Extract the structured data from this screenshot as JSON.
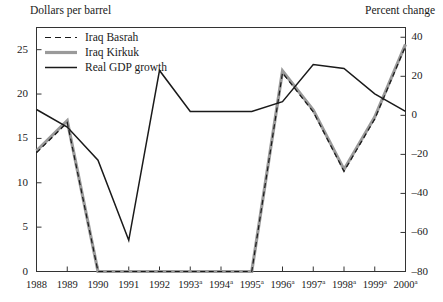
{
  "chart_data": {
    "type": "line",
    "title": "",
    "xlabel": "",
    "ylabel": "Dollars per barrel",
    "ylabel_right": "Percent change",
    "grid": false,
    "legend_position": "top-left",
    "categories": [
      "1988",
      "1989",
      "1990",
      "1991",
      "1992",
      "1993a",
      "1994a",
      "1995a",
      "1996a",
      "1997a",
      "1998a",
      "1999a",
      "2000a"
    ],
    "x": [
      1988,
      1989,
      1990,
      1991,
      1992,
      1993,
      1994,
      1995,
      1996,
      1997,
      1998,
      1999,
      2000
    ],
    "ylim": [
      0,
      27.5
    ],
    "yticks": [
      0,
      5,
      10,
      15,
      20,
      25
    ],
    "ylim_right": [
      -80,
      45
    ],
    "yticks_right": [
      -80,
      -60,
      -40,
      -20,
      0,
      20,
      40
    ],
    "series": [
      {
        "name": "Iraq Basrah",
        "axis": "left",
        "style": "dashed",
        "color": "#1a1a1a",
        "values": [
          13.4,
          16.8,
          0,
          0,
          0,
          0,
          0,
          0,
          22.4,
          18.0,
          11.3,
          17.2,
          25.4
        ]
      },
      {
        "name": "Iraq Kirkuk",
        "axis": "left",
        "style": "solid-thick",
        "color": "#9a9a9a",
        "values": [
          13.6,
          17.0,
          0,
          0,
          0,
          0,
          0,
          0,
          22.6,
          18.2,
          11.5,
          17.4,
          25.6
        ]
      },
      {
        "name": "Real GDP growth",
        "axis": "right",
        "style": "solid",
        "color": "#1a1a1a",
        "values": [
          3,
          -6,
          -23,
          -64,
          23,
          2,
          2,
          2,
          7,
          26,
          24,
          11,
          2
        ]
      }
    ],
    "legend": [
      {
        "label": "Iraq Basrah",
        "swatch": "dashed-line"
      },
      {
        "label": "Iraq Kirkuk",
        "swatch": "thick-gray-line"
      },
      {
        "label": "Real GDP growth",
        "swatch": "solid-black-line"
      }
    ],
    "tick_labels_left": [
      "25",
      "20",
      "15",
      "10",
      "5",
      "0"
    ],
    "tick_labels_right": [
      "40",
      "20",
      "0",
      "–20",
      "–40",
      "–60",
      "–80"
    ],
    "axis_colors": {
      "frame": "#333333",
      "text": "#1a1a1a"
    }
  }
}
